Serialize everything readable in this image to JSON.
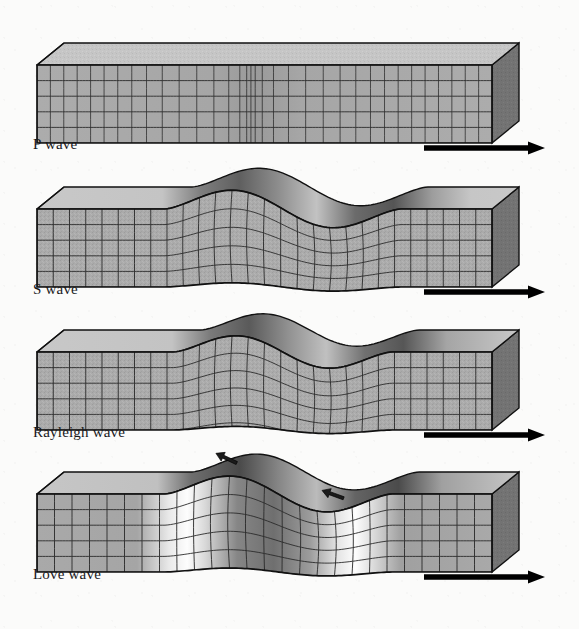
{
  "figure": {
    "background_color": "#fbfbfa",
    "block_fill": "#a8a8a8",
    "block_top_fill": "#c9c9c9",
    "block_side_fill": "#6f6f6f",
    "grid_line_color": "#2b2b2b",
    "outline_color": "#111111",
    "arrow_color": "#000000",
    "label_color": "#18181a"
  },
  "panels": [
    {
      "id": "p-wave",
      "label": "P wave",
      "wave_type": "compressional",
      "motion": "particle motion parallel to propagation; alternating compression and dilatation",
      "surface_profile": "flat",
      "grid_columns": 34,
      "grid_rows": 5,
      "compression_center_fraction": 0.47,
      "compression_strength": 0.72,
      "arrow": {
        "label": "direction of propagation",
        "direction": "right"
      }
    },
    {
      "id": "s-wave",
      "label": "S wave",
      "wave_type": "shear / transverse",
      "motion": "particle motion perpendicular to propagation; whole block flexes vertically",
      "surface_profile": "sinusoidal",
      "grid_columns": 28,
      "grid_rows": 5,
      "wave_amplitude": 22,
      "wave_cycles": 1.0,
      "wave_start_fraction": 0.28,
      "wave_end_fraction": 0.8,
      "arrow": {
        "label": "direction of propagation",
        "direction": "right"
      }
    },
    {
      "id": "rayleigh-wave",
      "label": "Rayleigh wave",
      "wave_type": "surface / retrograde elliptical",
      "motion": "rolling elliptical motion confined near the free surface; amplitude decays with depth",
      "surface_profile": "single ripple crest with leading trough",
      "grid_columns": 28,
      "grid_rows": 5,
      "wave_amplitude": 19,
      "wave_cycles": 1.0,
      "wave_start_fraction": 0.3,
      "wave_end_fraction": 0.78,
      "depth_decay": 0.55,
      "arrow": {
        "label": "direction of propagation",
        "direction": "right"
      }
    },
    {
      "id": "love-wave",
      "label": "Love wave",
      "wave_type": "surface / horizontal shear",
      "motion": "side-to-side horizontal shearing of the surface layer, transverse to propagation",
      "surface_profile": "single ripple crest with leading trough",
      "grid_columns": 26,
      "grid_rows": 5,
      "wave_amplitude": 21,
      "wave_cycles": 1.0,
      "wave_start_fraction": 0.28,
      "wave_end_fraction": 0.78,
      "highlight_bands": 2,
      "surface_arrows": [
        {
          "id": "love-shear-arrow-trough",
          "points": "down-left",
          "location": "trough"
        },
        {
          "id": "love-shear-arrow-crest",
          "points": "up-left",
          "location": "crest"
        }
      ],
      "arrow": {
        "label": "direction of propagation",
        "direction": "right"
      }
    }
  ]
}
